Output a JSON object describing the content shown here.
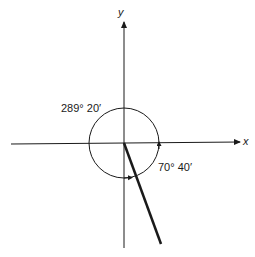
{
  "diagram": {
    "axes": {
      "x_label": "x",
      "y_label": "y"
    },
    "angles": [
      {
        "label": "289° 20′",
        "direction": "counterclockwise"
      },
      {
        "label": "70° 40′",
        "direction": "clockwise"
      }
    ],
    "terminal_side": "fourth quadrant ray",
    "colors": {
      "ink": "#1a1a1a",
      "background": "#ffffff"
    }
  }
}
